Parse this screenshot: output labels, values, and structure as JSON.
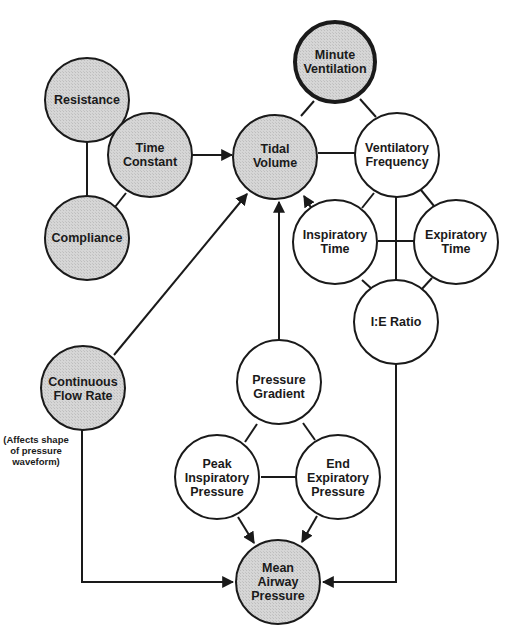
{
  "diagram": {
    "type": "concept-relationship",
    "colors": {
      "shaded_node": "#d4d4d4",
      "plain_node": "#ffffff",
      "stroke": "#1a1a1a"
    },
    "nodes": {
      "resistance": {
        "lines": [
          "Resistance"
        ],
        "shaded": true
      },
      "time_constant": {
        "lines": [
          "Time",
          "Constant"
        ],
        "shaded": true
      },
      "compliance": {
        "lines": [
          "Compliance"
        ],
        "shaded": true
      },
      "minute_ventilation": {
        "lines": [
          "Minute",
          "Ventilation"
        ],
        "shaded": true,
        "emphasized": true
      },
      "tidal_volume": {
        "lines": [
          "Tidal",
          "Volume"
        ],
        "shaded": true
      },
      "ventilatory_frequency": {
        "lines": [
          "Ventilatory",
          "Frequency"
        ],
        "shaded": false
      },
      "inspiratory_time": {
        "lines": [
          "Inspiratory",
          "Time"
        ],
        "shaded": false
      },
      "expiratory_time": {
        "lines": [
          "Expiratory",
          "Time"
        ],
        "shaded": false
      },
      "ie_ratio": {
        "lines": [
          "I:E Ratio"
        ],
        "shaded": false
      },
      "continuous_flow_rate": {
        "lines": [
          "Continuous",
          "Flow Rate"
        ],
        "shaded": true
      },
      "pressure_gradient": {
        "lines": [
          "Pressure",
          "Gradient"
        ],
        "shaded": false
      },
      "peak_inspiratory_pressure": {
        "lines": [
          "Peak",
          "Inspiratory",
          "Pressure"
        ],
        "shaded": false
      },
      "end_expiratory_pressure": {
        "lines": [
          "End",
          "Expiratory",
          "Pressure"
        ],
        "shaded": false
      },
      "mean_airway_pressure": {
        "lines": [
          "Mean",
          "Airway",
          "Pressure"
        ],
        "shaded": true
      }
    },
    "annotation": {
      "lines": [
        "(Affects shape",
        "of pressure",
        "waveform)"
      ]
    },
    "edges": [
      {
        "from": "Resistance",
        "to": "Compliance",
        "directed": false
      },
      {
        "from": "Resistance",
        "to": "Time Constant",
        "directed": false
      },
      {
        "from": "Compliance",
        "to": "Time Constant",
        "directed": false
      },
      {
        "from": "Time Constant",
        "to": "Tidal Volume",
        "directed": true
      },
      {
        "from": "Minute Ventilation",
        "to": "Tidal Volume",
        "directed": false
      },
      {
        "from": "Minute Ventilation",
        "to": "Ventilatory Frequency",
        "directed": false
      },
      {
        "from": "Tidal Volume",
        "to": "Ventilatory Frequency",
        "directed": false
      },
      {
        "from": "Ventilatory Frequency",
        "to": "Inspiratory Time",
        "directed": false
      },
      {
        "from": "Ventilatory Frequency",
        "to": "Expiratory Time",
        "directed": false
      },
      {
        "from": "Ventilatory Frequency",
        "to": "I:E Ratio",
        "directed": false
      },
      {
        "from": "Inspiratory Time",
        "to": "Expiratory Time",
        "directed": false
      },
      {
        "from": "Inspiratory Time",
        "to": "I:E Ratio",
        "directed": false
      },
      {
        "from": "Expiratory Time",
        "to": "I:E Ratio",
        "directed": false
      },
      {
        "from": "Inspiratory Time",
        "to": "Tidal Volume",
        "directed": true
      },
      {
        "from": "Continuous Flow Rate",
        "to": "Tidal Volume",
        "directed": true
      },
      {
        "from": "Pressure Gradient",
        "to": "Tidal Volume",
        "directed": true
      },
      {
        "from": "Pressure Gradient",
        "to": "Peak Inspiratory Pressure",
        "directed": false
      },
      {
        "from": "Pressure Gradient",
        "to": "End Expiratory Pressure",
        "directed": false
      },
      {
        "from": "Peak Inspiratory Pressure",
        "to": "End Expiratory Pressure",
        "directed": false
      },
      {
        "from": "Peak Inspiratory Pressure",
        "to": "Mean Airway Pressure",
        "directed": true
      },
      {
        "from": "End Expiratory Pressure",
        "to": "Mean Airway Pressure",
        "directed": true
      },
      {
        "from": "Continuous Flow Rate",
        "to": "Mean Airway Pressure",
        "directed": true
      },
      {
        "from": "I:E Ratio",
        "to": "Mean Airway Pressure",
        "directed": true
      }
    ]
  }
}
